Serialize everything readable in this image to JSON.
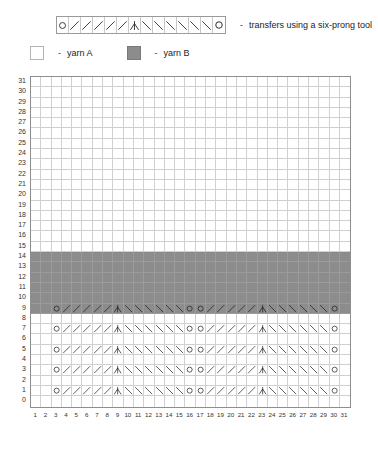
{
  "legend": {
    "symbol_strip": {
      "name": "six-prong-transfer-strip",
      "cells": [
        "O",
        "/",
        "/",
        "/",
        "/",
        "/",
        "A",
        "\\",
        "\\",
        "\\",
        "\\",
        "\\",
        "\\",
        "O"
      ],
      "dash": "-",
      "description": "transfers using a six-prong tool"
    },
    "yarns": [
      {
        "dash": "-",
        "label": "yarn A",
        "color": "#ffffff",
        "key": "A"
      },
      {
        "dash": "-",
        "label": "yarn B",
        "color": "#8c8c8c",
        "key": "B"
      }
    ]
  },
  "chart_data": {
    "type": "heatmap",
    "title": "",
    "xlabel": "",
    "ylabel": "",
    "columns": 31,
    "rows": 32,
    "row_labels": [
      31,
      30,
      29,
      28,
      27,
      26,
      25,
      24,
      23,
      22,
      21,
      20,
      19,
      18,
      17,
      16,
      15,
      14,
      13,
      12,
      11,
      10,
      9,
      8,
      7,
      6,
      5,
      4,
      3,
      2,
      1,
      0
    ],
    "col_labels": [
      1,
      2,
      3,
      4,
      5,
      6,
      7,
      8,
      9,
      10,
      11,
      12,
      13,
      14,
      15,
      16,
      17,
      18,
      19,
      20,
      21,
      22,
      23,
      24,
      25,
      26,
      27,
      28,
      29,
      30,
      31
    ],
    "grid": true,
    "yarn_b_rows": [
      9,
      10,
      11,
      12,
      13,
      14
    ],
    "yarn_b_color": "#8c8c8c",
    "yarn_a_color": "#ffffff",
    "pattern_rows": [
      1,
      3,
      5,
      7,
      9
    ],
    "motif_start_columns": [
      3,
      17
    ],
    "motif_cells": [
      "O",
      "/",
      "/",
      "/",
      "/",
      "/",
      "A",
      "\\",
      "\\",
      "\\",
      "\\",
      "\\",
      "\\"
    ],
    "motif_length": 13,
    "symbols": {
      "O": "eyelet-circle",
      "/": "right-leaning-transfer",
      "\\": "left-leaning-transfer",
      "A": "center-double-transfer"
    }
  }
}
